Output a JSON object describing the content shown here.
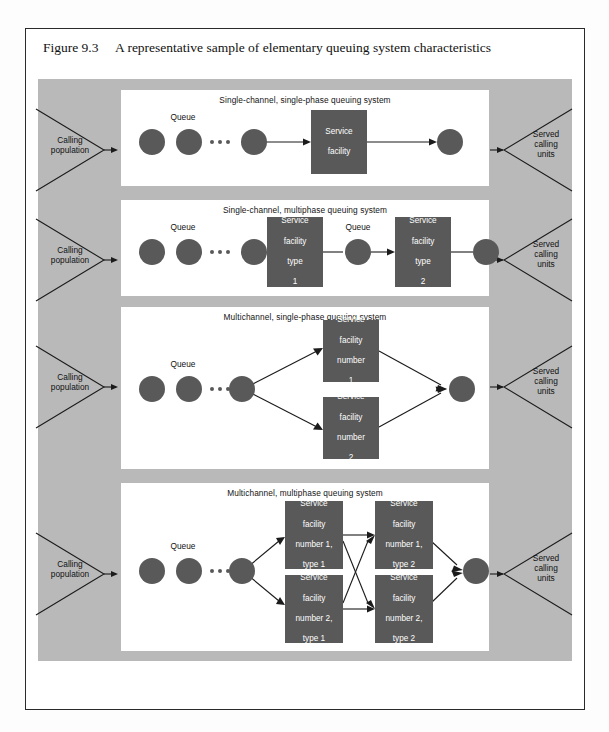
{
  "caption": {
    "figure_number": "Figure 9.3",
    "text": "A representative sample of elementary queuing system characteristics"
  },
  "colors": {
    "backdrop_gray": "#b9b9b9",
    "panel_white": "#ffffff",
    "node_dark": "#595959",
    "text_dark": "#111111",
    "box_text": "#ffffff",
    "frame_border": "#2a2a2a"
  },
  "labels": {
    "calling_population": "Calling\npopulation",
    "calling_population_line1": "Calling",
    "calling_population_line2": "population",
    "served_units_line1": "Served",
    "served_units_line2": "calling",
    "served_units_line3": "units",
    "queue": "Queue"
  },
  "panels": [
    {
      "id": "single-channel-single-phase",
      "title": "Single-channel, single-phase queuing system",
      "queue_label": "Queue",
      "facilities": [
        {
          "id": "service-facility",
          "lines": [
            "Service",
            "facility"
          ]
        }
      ]
    },
    {
      "id": "single-channel-multiphase",
      "title": "Single-channel, multiphase queuing system",
      "queue_label": "Queue",
      "queue_label_mid": "Queue",
      "facilities": [
        {
          "id": "service-facility-type-1",
          "lines": [
            "Service",
            "facility",
            "type",
            "1"
          ]
        },
        {
          "id": "service-facility-type-2",
          "lines": [
            "Service",
            "facility",
            "type",
            "2"
          ]
        }
      ]
    },
    {
      "id": "multichannel-single-phase",
      "title": "Multichannel, single-phase queuing system",
      "queue_label": "Queue",
      "facilities": [
        {
          "id": "service-facility-number-1",
          "lines": [
            "Service",
            "facility",
            "number",
            "1"
          ]
        },
        {
          "id": "service-facility-number-2",
          "lines": [
            "Service",
            "facility",
            "number",
            "2"
          ]
        }
      ]
    },
    {
      "id": "multichannel-multiphase",
      "title": "Multichannel, multiphase queuing system",
      "queue_label": "Queue",
      "facilities": [
        {
          "id": "service-facility-number-1-type-1",
          "lines": [
            "Service",
            "facility",
            "number 1,",
            "type 1"
          ]
        },
        {
          "id": "service-facility-number-2-type-1",
          "lines": [
            "Service",
            "facility",
            "number 2,",
            "type 1"
          ]
        },
        {
          "id": "service-facility-number-1-type-2",
          "lines": [
            "Service",
            "facility",
            "number 1,",
            "type 2"
          ]
        },
        {
          "id": "service-facility-number-2-type-2",
          "lines": [
            "Service",
            "facility",
            "number 2,",
            "type 2"
          ]
        }
      ]
    }
  ]
}
